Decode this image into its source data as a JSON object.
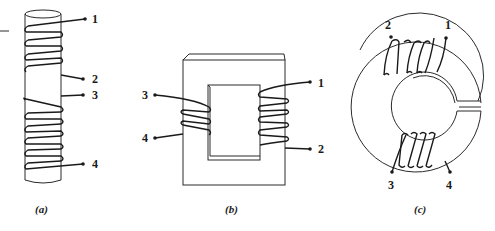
{
  "figure": {
    "panels": [
      {
        "id": "a",
        "caption": "(a)",
        "description": "Two coils wound on a single cylindrical core",
        "terminals": [
          "1",
          "2",
          "3",
          "4"
        ]
      },
      {
        "id": "b",
        "caption": "(b)",
        "description": "Two coils wound on opposite legs of a rectangular core",
        "terminals": [
          "1",
          "2",
          "3",
          "4"
        ]
      },
      {
        "id": "c",
        "caption": "(c)",
        "description": "Two coils wound on a toroidal core with an air gap",
        "terminals": [
          "1",
          "2",
          "3",
          "4"
        ]
      }
    ],
    "colors": {
      "ink": "#1a1a1a",
      "background": "#ffffff"
    }
  }
}
